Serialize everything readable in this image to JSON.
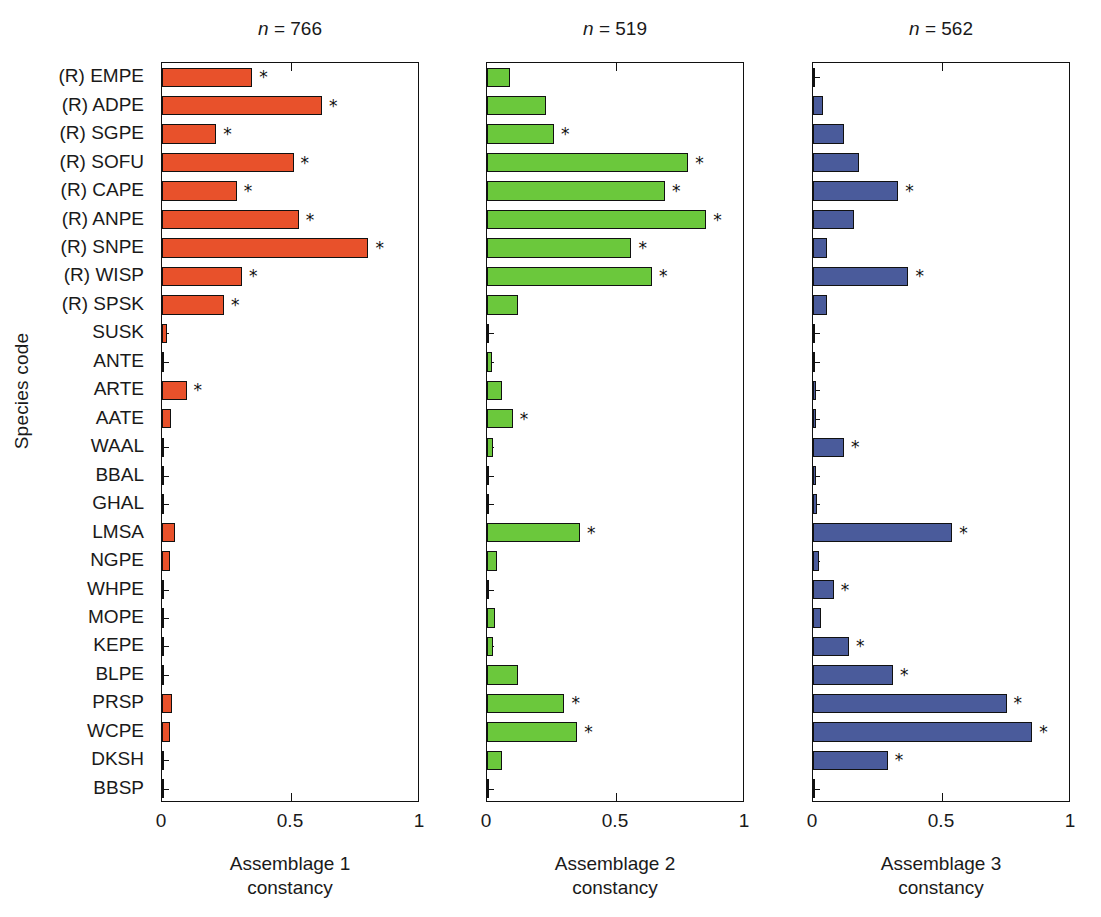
{
  "axes": {
    "y_title": "Species code",
    "x_ticks": [
      "0",
      "0.5",
      "1"
    ],
    "x_tick_values": [
      0,
      0.5,
      1
    ],
    "xlim": [
      0,
      1
    ],
    "significance_marker": "*"
  },
  "species": [
    "(R) EMPE",
    "(R) ADPE",
    "(R) SGPE",
    "(R) SOFU",
    "(R) CAPE",
    "(R) ANPE",
    "(R) SNPE",
    "(R) WISP",
    "(R) SPSK",
    "SUSK",
    "ANTE",
    "ARTE",
    "AATE",
    "WAAL",
    "BBAL",
    "GHAL",
    "LMSA",
    "NGPE",
    "WHPE",
    "MOPE",
    "KEPE",
    "BLPE",
    "PRSP",
    "WCPE",
    "DKSH",
    "BBSP"
  ],
  "chart_data": {
    "type": "bar",
    "orientation": "horizontal",
    "title": "",
    "xlabel": "constancy",
    "ylabel": "Species code",
    "xlim": [
      0,
      1
    ],
    "grid": false,
    "legend": "none",
    "categories": [
      "(R) EMPE",
      "(R) ADPE",
      "(R) SGPE",
      "(R) SOFU",
      "(R) CAPE",
      "(R) ANPE",
      "(R) SNPE",
      "(R) WISP",
      "(R) SPSK",
      "SUSK",
      "ANTE",
      "ARTE",
      "AATE",
      "WAAL",
      "BBAL",
      "GHAL",
      "LMSA",
      "NGPE",
      "WHPE",
      "MOPE",
      "KEPE",
      "BLPE",
      "PRSP",
      "WCPE",
      "DKSH",
      "BBSP"
    ],
    "panels": [
      {
        "id": "assemblage-1",
        "title": "n = 766",
        "n": 766,
        "xlabel_line1": "Assemblage 1",
        "xlabel_line2": "constancy",
        "color": "#E8512B",
        "values": [
          0.35,
          0.62,
          0.21,
          0.51,
          0.29,
          0.53,
          0.8,
          0.31,
          0.24,
          0.02,
          0.005,
          0.095,
          0.035,
          0.004,
          0.003,
          0.003,
          0.05,
          0.03,
          0.003,
          0.008,
          0.005,
          0.008,
          0.04,
          0.03,
          0.005,
          0.002
        ],
        "significant": [
          true,
          true,
          true,
          true,
          true,
          true,
          true,
          true,
          true,
          false,
          false,
          true,
          false,
          false,
          false,
          false,
          false,
          false,
          false,
          false,
          false,
          false,
          false,
          false,
          false,
          false
        ]
      },
      {
        "id": "assemblage-2",
        "title": "n = 519",
        "n": 519,
        "xlabel_line1": "Assemblage 2",
        "xlabel_line2": "constancy",
        "color": "#6BC83C",
        "values": [
          0.09,
          0.23,
          0.26,
          0.78,
          0.69,
          0.85,
          0.56,
          0.64,
          0.12,
          0.005,
          0.02,
          0.06,
          0.1,
          0.025,
          0.003,
          0.003,
          0.36,
          0.04,
          0.003,
          0.03,
          0.025,
          0.12,
          0.3,
          0.35,
          0.06,
          0.005
        ],
        "significant": [
          false,
          false,
          true,
          true,
          true,
          true,
          true,
          true,
          false,
          false,
          false,
          false,
          true,
          false,
          false,
          false,
          true,
          false,
          false,
          false,
          false,
          false,
          true,
          true,
          false,
          false
        ]
      },
      {
        "id": "assemblage-3",
        "title": "n = 562",
        "n": 562,
        "xlabel_line1": "Assemblage 3",
        "xlabel_line2": "constancy",
        "color": "#4A5B9B",
        "values": [
          0.005,
          0.04,
          0.12,
          0.18,
          0.33,
          0.16,
          0.055,
          0.37,
          0.055,
          0.003,
          0.002,
          0.012,
          0.012,
          0.12,
          0.012,
          0.015,
          0.54,
          0.025,
          0.08,
          0.03,
          0.14,
          0.31,
          0.75,
          0.85,
          0.29,
          0.005
        ],
        "significant": [
          false,
          false,
          false,
          false,
          true,
          false,
          false,
          true,
          false,
          false,
          false,
          false,
          false,
          true,
          false,
          false,
          true,
          false,
          true,
          false,
          true,
          true,
          true,
          true,
          true,
          false
        ]
      }
    ]
  }
}
